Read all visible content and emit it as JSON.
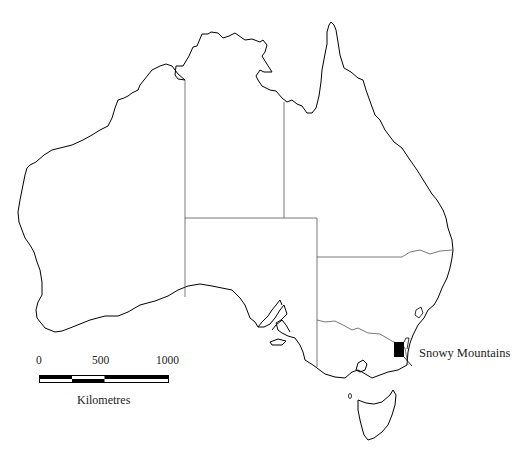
{
  "map": {
    "title": "Australia",
    "feature_label": "Snowy Mountains",
    "feature_color": "#000000",
    "outline_color": "#000000",
    "border_color": "#555555"
  },
  "scale_bar": {
    "ticks": [
      "0",
      "500",
      "1000"
    ],
    "unit_label": "Kilometres"
  }
}
